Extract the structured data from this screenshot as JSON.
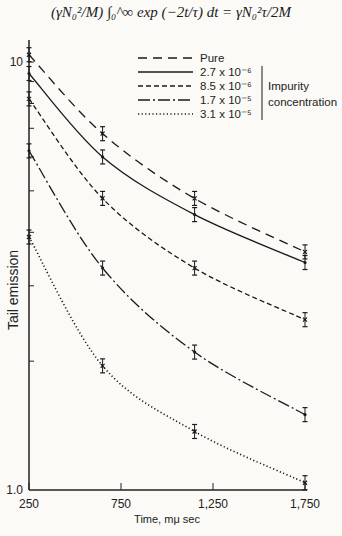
{
  "formula": "(γN₀²/M) ∫₀^∞ exp (−2t/τ) dt = γN₀²τ/2M",
  "chart_data": {
    "type": "line",
    "title": "(γN₀²/M) ∫₀^∞ exp (−2t/τ) dt = γN₀²τ/2M",
    "xlabel": "Time, mμ sec",
    "ylabel": "Tail emission",
    "yscale": "log",
    "xlim": [
      250,
      1750
    ],
    "ylim": [
      1.0,
      11
    ],
    "x_ticks": [
      "250",
      "750",
      "1,250",
      "1,750"
    ],
    "y_ticks": [
      "1.0",
      "10"
    ],
    "grid": false,
    "legend_position": "upper right",
    "legend_group_label": "Impurity concentration",
    "x": [
      250,
      650,
      1150,
      1750
    ],
    "series": [
      {
        "name": "Pure",
        "style": "long-dash",
        "marker": "x",
        "values": [
          10.4,
          6.8,
          4.8,
          3.6
        ]
      },
      {
        "name": "2.7 x 10⁻⁶",
        "style": "solid",
        "marker": "dot",
        "values": [
          9.4,
          6.0,
          4.4,
          3.4
        ]
      },
      {
        "name": "8.5 x 10⁻⁶",
        "style": "short-dash",
        "marker": "x",
        "values": [
          8.2,
          4.8,
          3.3,
          2.5
        ]
      },
      {
        "name": "1.7 x 10⁻⁵",
        "style": "dash-dot",
        "marker": "dot",
        "values": [
          6.2,
          3.3,
          2.1,
          1.5
        ]
      },
      {
        "name": "3.1 x 10⁻⁵",
        "style": "dotted",
        "marker": "x",
        "values": [
          3.9,
          1.95,
          1.37,
          1.04
        ]
      }
    ]
  }
}
